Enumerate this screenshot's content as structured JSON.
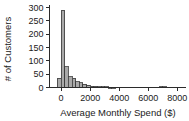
{
  "chart_data": {
    "type": "bar",
    "title": "",
    "subtitle": "",
    "xlabel": "Average Monthly Spend ($)",
    "ylabel": "# of Customers",
    "grid": false,
    "legend": false,
    "legend_position": "none",
    "xlim": [
      -800,
      8600
    ],
    "ylim": [
      0,
      310
    ],
    "xticks": [
      0,
      2000,
      4000,
      6000,
      8000
    ],
    "xtick_labels": [
      "0",
      "2000",
      "4000",
      "6000",
      "8000"
    ],
    "yticks": [
      0,
      50,
      100,
      150,
      200,
      250,
      300
    ],
    "ytick_labels": [
      "0",
      "50",
      "100",
      "150",
      "200",
      "250",
      "300"
    ],
    "bin_width": 250,
    "bin_starts": [
      -250,
      0,
      250,
      500,
      750,
      1000,
      1250,
      1500,
      1750,
      2000,
      2250,
      2500,
      2750,
      3000,
      3250,
      3500,
      6750,
      7000
    ],
    "categories": [
      "-250",
      "0",
      "250",
      "500",
      "750",
      "1000",
      "1250",
      "1500",
      "1750",
      "2000",
      "2250",
      "2500",
      "2750",
      "3000",
      "3250",
      "3500",
      "6750",
      "7000"
    ],
    "values": [
      35,
      290,
      78,
      40,
      35,
      22,
      18,
      12,
      8,
      5,
      4,
      3,
      2,
      2,
      1,
      1,
      3,
      3
    ],
    "bar_fill_color": "#a9a9a9",
    "bar_edge_color": "#3a3a3a",
    "background_color": "#ffffff",
    "axis_color": "#2b2b2b"
  },
  "axes": {
    "y_axis_title": "# of Customers",
    "x_axis_title": "Average Monthly Spend ($)"
  }
}
